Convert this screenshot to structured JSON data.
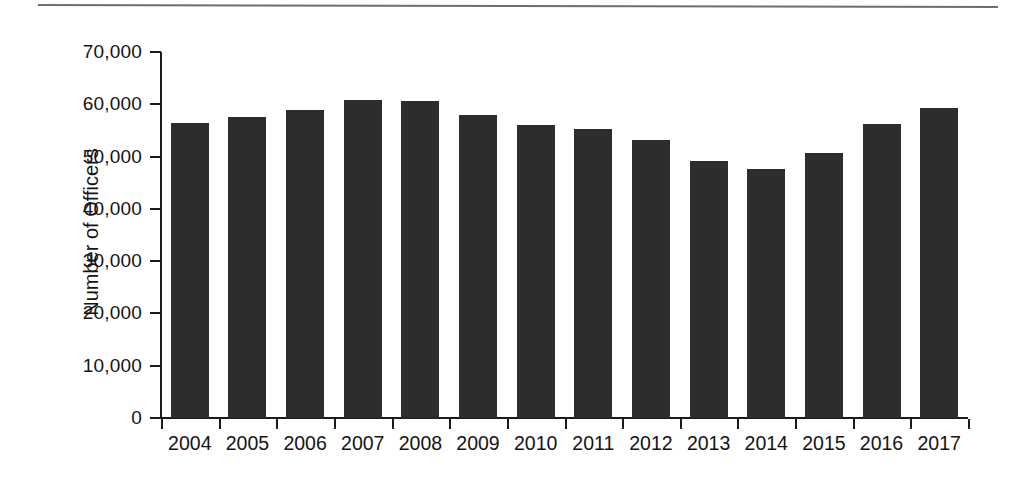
{
  "figure": {
    "has_top_rule": true,
    "background_color": "#ffffff",
    "bar_color": "#2d2d2d",
    "axis_color": "#1a1a1a"
  },
  "chart_data": {
    "type": "bar",
    "title": "",
    "subtitle": "",
    "xlabel": "",
    "ylabel": "Number of Officers",
    "categories": [
      "2004",
      "2005",
      "2006",
      "2007",
      "2008",
      "2009",
      "2010",
      "2011",
      "2012",
      "2013",
      "2014",
      "2015",
      "2016",
      "2017"
    ],
    "values": [
      56500,
      57600,
      59000,
      60900,
      60600,
      58000,
      56100,
      55200,
      53200,
      49200,
      47600,
      50700,
      56300,
      59300
    ],
    "ylim": [
      0,
      70000
    ],
    "ytick_values": [
      70000,
      60000,
      50000,
      40000,
      30000,
      20000,
      10000,
      0
    ],
    "ytick_labels": [
      "70,000",
      "60,000",
      "50,000",
      "40,000",
      "30,000",
      "20,000",
      "10,000",
      "0"
    ],
    "grid": false,
    "legend": null,
    "legend_position": "none",
    "annotations": []
  }
}
